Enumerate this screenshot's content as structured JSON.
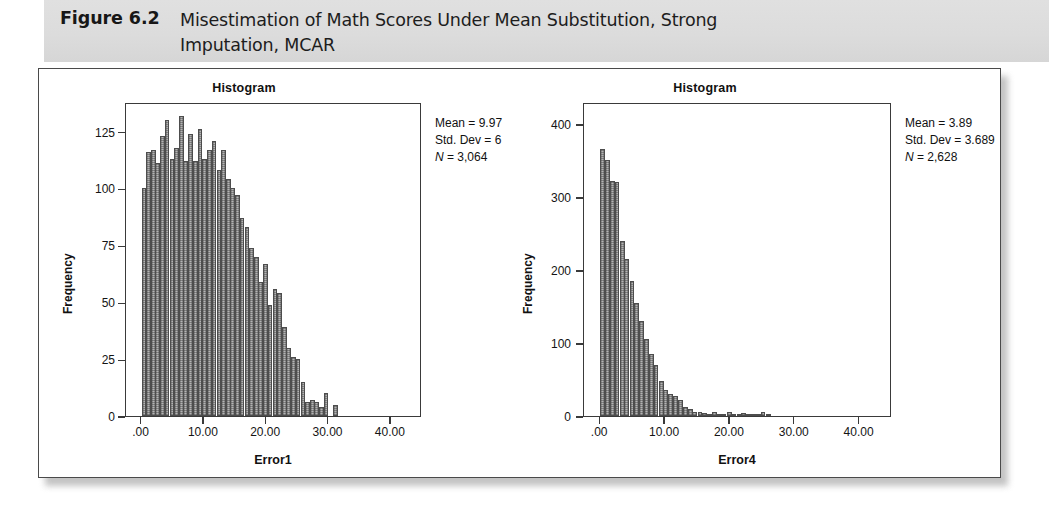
{
  "figure": {
    "label": "Figure 6.2",
    "title": "Misestimation of Math Scores Under Mean Substitution, Strong Imputation, MCAR"
  },
  "colors": {
    "header_band": "#dcdcdc",
    "panel_border": "#4a4a4a",
    "bar_fill": "#b4b4b4",
    "bar_edge": "#4d4d4d",
    "axis": "#3a3a3a",
    "text": "#111111"
  },
  "charts": [
    {
      "id": "left",
      "title": "Histogram",
      "xlabel": "Error1",
      "ylabel": "Frequency",
      "stats": {
        "mean_label": "Mean = 9.97",
        "sd_label": "Std. Dev = 6",
        "n_prefix": "N",
        "n_label": " = 3,064"
      }
    },
    {
      "id": "right",
      "title": "Histogram",
      "xlabel": "Error4",
      "ylabel": "Frequency",
      "stats": {
        "mean_label": "Mean = 3.89",
        "sd_label": "Std. Dev = 3.689",
        "n_prefix": "N",
        "n_label": " = 2,628"
      }
    }
  ],
  "chart_data": [
    {
      "type": "bar",
      "id": "histogram-error1",
      "title": "Histogram",
      "xlabel": "Error1",
      "ylabel": "Frequency",
      "xlim": [
        -2.5,
        45.0
      ],
      "ylim": [
        0,
        138
      ],
      "xticks": [
        0,
        10,
        20,
        30,
        40
      ],
      "xticklabels": [
        ".00",
        "10.00",
        "20.00",
        "30.00",
        "40.00"
      ],
      "yticks": [
        0,
        25,
        50,
        75,
        100,
        125
      ],
      "yticklabels": [
        "0",
        "25",
        "50",
        "75",
        "100",
        "125"
      ],
      "grid": false,
      "legend": false,
      "annotations": [
        "Mean = 9.97",
        "Std. Dev = 6",
        "N = 3,064"
      ],
      "bin_width": 0.75,
      "bin_centers": [
        0.4,
        1.1,
        1.9,
        2.6,
        3.4,
        4.1,
        4.9,
        5.6,
        6.4,
        7.1,
        7.9,
        8.6,
        9.4,
        10.1,
        10.9,
        11.6,
        12.4,
        13.1,
        13.9,
        14.6,
        15.4,
        16.1,
        16.9,
        17.6,
        18.4,
        19.1,
        19.9,
        20.6,
        21.4,
        22.1,
        22.9,
        23.6,
        24.4,
        25.1,
        25.9,
        26.6,
        27.4,
        28.1,
        28.9,
        29.6,
        30.4,
        31.1,
        31.9,
        32.6
      ],
      "values": [
        100,
        116,
        117,
        111,
        123,
        130,
        113,
        118,
        132,
        112,
        124,
        112,
        126,
        113,
        117,
        121,
        108,
        117,
        104,
        100,
        97,
        87,
        83,
        74,
        70,
        59,
        67,
        49,
        56,
        54,
        39,
        30,
        26,
        25,
        15,
        6,
        7,
        6,
        4,
        10,
        0,
        5,
        0,
        0
      ]
    },
    {
      "type": "bar",
      "id": "histogram-error4",
      "title": "Histogram",
      "xlabel": "Error4",
      "ylabel": "Frequency",
      "xlim": [
        -2.5,
        45.0
      ],
      "ylim": [
        0,
        430
      ],
      "xticks": [
        0,
        10,
        20,
        30,
        40
      ],
      "xticklabels": [
        ".00",
        "10.00",
        "20.00",
        "30.00",
        "40.00"
      ],
      "yticks": [
        0,
        100,
        200,
        300,
        400
      ],
      "yticklabels": [
        "0",
        "100",
        "200",
        "300",
        "400"
      ],
      "grid": false,
      "legend": false,
      "annotations": [
        "Mean = 3.89",
        "Std. Dev = 3.689",
        "N = 2,628"
      ],
      "bin_width": 0.75,
      "bin_centers": [
        0.4,
        1.1,
        1.9,
        2.6,
        3.4,
        4.1,
        4.9,
        5.6,
        6.4,
        7.1,
        7.9,
        8.6,
        9.4,
        10.1,
        10.9,
        11.6,
        12.4,
        13.1,
        13.9,
        14.6,
        15.4,
        16.1,
        16.9,
        17.6,
        18.4,
        19.1,
        19.9,
        20.6,
        21.4,
        22.1,
        22.9,
        23.6,
        24.4,
        25.1,
        25.9,
        26.6,
        27.4,
        28.1,
        28.9,
        29.6,
        30.4,
        31.1,
        31.9,
        32.6,
        33.4,
        34.1
      ],
      "values": [
        365,
        350,
        322,
        320,
        240,
        215,
        185,
        155,
        130,
        105,
        85,
        70,
        48,
        35,
        30,
        28,
        22,
        12,
        10,
        6,
        5,
        4,
        3,
        6,
        2,
        2,
        5,
        1,
        1,
        4,
        1,
        1,
        1,
        5,
        1,
        0,
        0,
        0,
        0,
        0,
        0,
        0,
        0,
        0,
        0,
        0
      ]
    }
  ]
}
